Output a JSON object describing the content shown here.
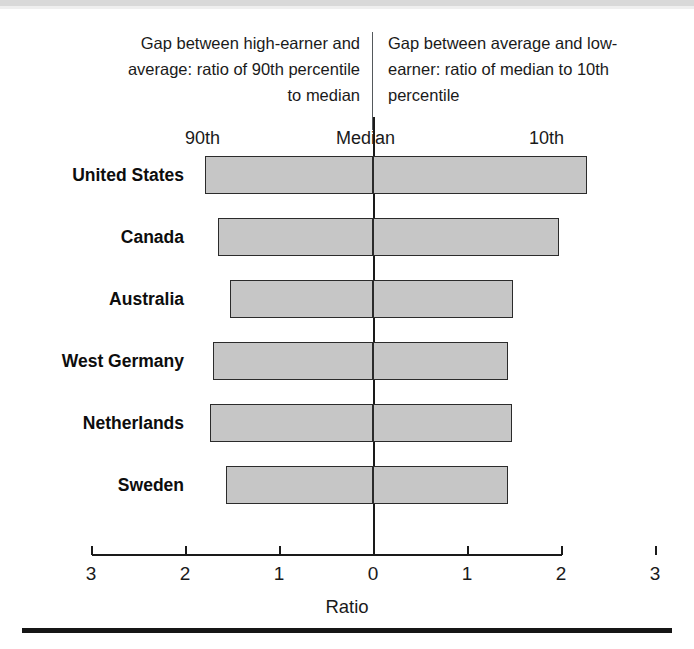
{
  "header": {
    "left_caption": "Gap between high-earner and average: ratio of 90th percentile to median",
    "right_caption": "Gap between average and low-earner: ratio of median to 10th percentile",
    "col_label_left": "90th",
    "col_label_center": "Median",
    "col_label_right": "10th"
  },
  "colors": {
    "bar_fill": "#c6c6c6",
    "bar_stroke": "#2b2b2b",
    "axis": "#1a1a1a",
    "text": "#1a1a1a",
    "top_band": "#d9d9d9",
    "bottom_rule": "#161616"
  },
  "chart_data": {
    "type": "bar",
    "orientation": "horizontal",
    "subtype": "diverging-bar",
    "title": "",
    "xlabel": "Ratio",
    "ylabel": "",
    "xlim": [
      -3,
      3
    ],
    "grid": false,
    "legend": null,
    "axis_tick_values": [
      -3,
      -2,
      -1,
      0,
      1,
      2,
      3
    ],
    "axis_tick_labels": [
      "3",
      "2",
      "1",
      "0",
      "1",
      "2",
      "3"
    ],
    "categories": [
      "United States",
      "Canada",
      "Australia",
      "West Germany",
      "Netherlands",
      "Sweden"
    ],
    "series": [
      {
        "name": "Gap between high-earner and average: ratio of 90th percentile to median",
        "side": "left",
        "values": [
          1.79,
          1.65,
          1.52,
          1.7,
          1.73,
          1.56
        ]
      },
      {
        "name": "Gap between average and low-earner: ratio of median to 10th percentile",
        "side": "right",
        "values": [
          2.28,
          1.98,
          1.49,
          1.44,
          1.48,
          1.44
        ]
      }
    ],
    "annotations": [
      {
        "text": "90th",
        "position": "left-header"
      },
      {
        "text": "Median",
        "position": "center-header"
      },
      {
        "text": "10th",
        "position": "right-header"
      }
    ]
  }
}
